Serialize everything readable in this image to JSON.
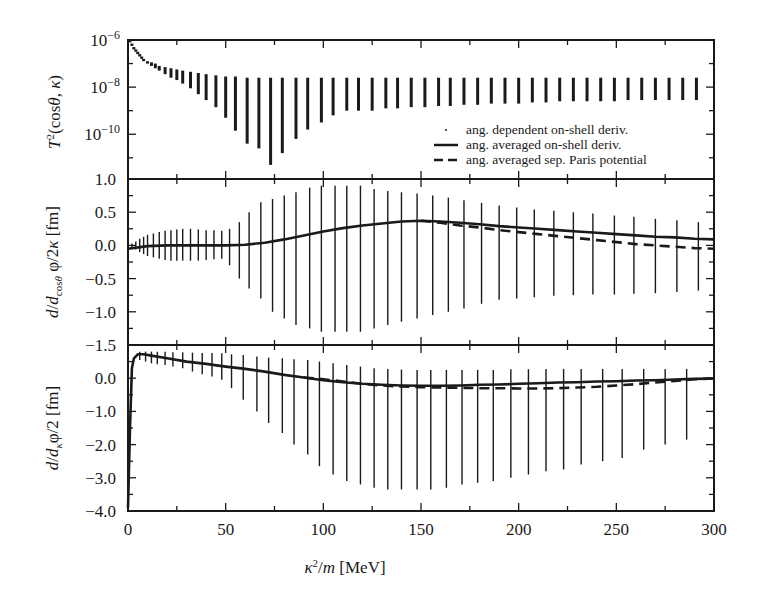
{
  "chart_data": [
    {
      "panel": "top",
      "type": "scatter",
      "ylabel": "T^2(cosθ, κ)",
      "yscale": "log",
      "ylim_exp": [
        -11.9,
        -6
      ],
      "yticks": [
        {
          "exp": -6,
          "label_base": "10",
          "label_exp": "−6"
        },
        {
          "exp": -8,
          "label_base": "10",
          "label_exp": "−8"
        },
        {
          "exp": -10,
          "label_base": "10",
          "label_exp": "−10"
        }
      ],
      "description": "Angle-dependent squared T-matrix: vertical bands of values per energy, log scale",
      "bands": [
        {
          "x": 1,
          "lo": -6.1,
          "hi": -6.0
        },
        {
          "x": 2,
          "lo": -6.25,
          "hi": -6.15
        },
        {
          "x": 3,
          "lo": -6.4,
          "hi": -6.3
        },
        {
          "x": 4,
          "lo": -6.5,
          "hi": -6.4
        },
        {
          "x": 5,
          "lo": -6.6,
          "hi": -6.5
        },
        {
          "x": 6,
          "lo": -6.7,
          "hi": -6.6
        },
        {
          "x": 7,
          "lo": -6.8,
          "hi": -6.7
        },
        {
          "x": 8,
          "lo": -6.9,
          "hi": -6.8
        },
        {
          "x": 10,
          "lo": -7.0,
          "hi": -6.9
        },
        {
          "x": 12,
          "lo": -7.1,
          "hi": -6.95
        },
        {
          "x": 14,
          "lo": -7.2,
          "hi": -7.0
        },
        {
          "x": 16,
          "lo": -7.3,
          "hi": -7.1
        },
        {
          "x": 19,
          "lo": -7.45,
          "hi": -7.15
        },
        {
          "x": 22,
          "lo": -7.6,
          "hi": -7.2
        },
        {
          "x": 25,
          "lo": -7.7,
          "hi": -7.25
        },
        {
          "x": 28,
          "lo": -7.85,
          "hi": -7.3
        },
        {
          "x": 32,
          "lo": -8.05,
          "hi": -7.35
        },
        {
          "x": 36,
          "lo": -8.3,
          "hi": -7.4
        },
        {
          "x": 40,
          "lo": -8.55,
          "hi": -7.45
        },
        {
          "x": 45,
          "lo": -8.85,
          "hi": -7.5
        },
        {
          "x": 50,
          "lo": -9.3,
          "hi": -7.55
        },
        {
          "x": 55,
          "lo": -9.85,
          "hi": -7.55
        },
        {
          "x": 61,
          "lo": -10.4,
          "hi": -7.6
        },
        {
          "x": 67,
          "lo": -10.6,
          "hi": -7.6
        },
        {
          "x": 73,
          "lo": -11.3,
          "hi": -7.6
        },
        {
          "x": 79,
          "lo": -10.8,
          "hi": -7.6
        },
        {
          "x": 86,
          "lo": -10.2,
          "hi": -7.6
        },
        {
          "x": 92,
          "lo": -9.8,
          "hi": -7.6
        },
        {
          "x": 99,
          "lo": -9.5,
          "hi": -7.6
        },
        {
          "x": 105,
          "lo": -9.2,
          "hi": -7.6
        },
        {
          "x": 112,
          "lo": -9.0,
          "hi": -7.6
        },
        {
          "x": 118,
          "lo": -9.0,
          "hi": -7.6
        },
        {
          "x": 125,
          "lo": -9.0,
          "hi": -7.6
        },
        {
          "x": 132,
          "lo": -8.9,
          "hi": -7.6
        },
        {
          "x": 138,
          "lo": -8.9,
          "hi": -7.6
        },
        {
          "x": 145,
          "lo": -8.85,
          "hi": -7.6
        },
        {
          "x": 152,
          "lo": -8.85,
          "hi": -7.6
        },
        {
          "x": 159,
          "lo": -8.8,
          "hi": -7.6
        },
        {
          "x": 165,
          "lo": -8.8,
          "hi": -7.6
        },
        {
          "x": 172,
          "lo": -8.75,
          "hi": -7.6
        },
        {
          "x": 179,
          "lo": -8.75,
          "hi": -7.6
        },
        {
          "x": 186,
          "lo": -8.7,
          "hi": -7.6
        },
        {
          "x": 193,
          "lo": -8.7,
          "hi": -7.6
        },
        {
          "x": 200,
          "lo": -8.7,
          "hi": -7.6
        },
        {
          "x": 207,
          "lo": -8.65,
          "hi": -7.6
        },
        {
          "x": 214,
          "lo": -8.65,
          "hi": -7.6
        },
        {
          "x": 221,
          "lo": -8.6,
          "hi": -7.6
        },
        {
          "x": 228,
          "lo": -8.6,
          "hi": -7.6
        },
        {
          "x": 235,
          "lo": -8.6,
          "hi": -7.6
        },
        {
          "x": 242,
          "lo": -8.6,
          "hi": -7.6
        },
        {
          "x": 249,
          "lo": -8.6,
          "hi": -7.6
        },
        {
          "x": 256,
          "lo": -8.55,
          "hi": -7.6
        },
        {
          "x": 263,
          "lo": -8.55,
          "hi": -7.6
        },
        {
          "x": 270,
          "lo": -8.55,
          "hi": -7.6
        },
        {
          "x": 277,
          "lo": -8.55,
          "hi": -7.6
        },
        {
          "x": 284,
          "lo": -8.55,
          "hi": -7.6
        },
        {
          "x": 291,
          "lo": -8.55,
          "hi": -7.6
        }
      ]
    },
    {
      "panel": "middle",
      "type": "line",
      "ylabel": "d/d_cosθ φ/2κ [fm]",
      "ylim": [
        -1.5,
        1.0
      ],
      "yticks": [
        "1.0",
        "0.5",
        "0.0",
        "−0.5",
        "−1.0",
        "−1.5"
      ],
      "ytick_values": [
        1.0,
        0.5,
        0.0,
        -0.5,
        -1.0,
        -1.5
      ],
      "bands": [
        {
          "x": 2,
          "lo": -0.03,
          "hi": 0.03
        },
        {
          "x": 4,
          "lo": -0.06,
          "hi": 0.06
        },
        {
          "x": 6,
          "lo": -0.1,
          "hi": 0.1
        },
        {
          "x": 8,
          "lo": -0.13,
          "hi": 0.13
        },
        {
          "x": 10,
          "lo": -0.16,
          "hi": 0.16
        },
        {
          "x": 13,
          "lo": -0.18,
          "hi": 0.18
        },
        {
          "x": 16,
          "lo": -0.2,
          "hi": 0.2
        },
        {
          "x": 19,
          "lo": -0.22,
          "hi": 0.22
        },
        {
          "x": 22,
          "lo": -0.23,
          "hi": 0.23
        },
        {
          "x": 25,
          "lo": -0.23,
          "hi": 0.24
        },
        {
          "x": 28,
          "lo": -0.23,
          "hi": 0.25
        },
        {
          "x": 32,
          "lo": -0.23,
          "hi": 0.25
        },
        {
          "x": 36,
          "lo": -0.23,
          "hi": 0.24
        },
        {
          "x": 40,
          "lo": -0.22,
          "hi": 0.23
        },
        {
          "x": 44,
          "lo": -0.21,
          "hi": 0.23
        },
        {
          "x": 48,
          "lo": -0.2,
          "hi": 0.22
        },
        {
          "x": 52,
          "lo": -0.3,
          "hi": 0.25
        },
        {
          "x": 57,
          "lo": -0.5,
          "hi": 0.35
        },
        {
          "x": 62,
          "lo": -0.65,
          "hi": 0.5
        },
        {
          "x": 68,
          "lo": -0.8,
          "hi": 0.65
        },
        {
          "x": 74,
          "lo": -1.0,
          "hi": 0.7
        },
        {
          "x": 80,
          "lo": -1.1,
          "hi": 0.75
        },
        {
          "x": 86,
          "lo": -1.2,
          "hi": 0.8
        },
        {
          "x": 93,
          "lo": -1.25,
          "hi": 0.87
        },
        {
          "x": 99,
          "lo": -1.3,
          "hi": 0.9
        },
        {
          "x": 106,
          "lo": -1.3,
          "hi": 0.9
        },
        {
          "x": 112,
          "lo": -1.3,
          "hi": 0.9
        },
        {
          "x": 119,
          "lo": -1.3,
          "hi": 0.9
        },
        {
          "x": 126,
          "lo": -1.25,
          "hi": 0.85
        },
        {
          "x": 133,
          "lo": -1.2,
          "hi": 0.82
        },
        {
          "x": 140,
          "lo": -1.15,
          "hi": 0.8
        },
        {
          "x": 148,
          "lo": -1.1,
          "hi": 0.78
        },
        {
          "x": 156,
          "lo": -1.05,
          "hi": 0.75
        },
        {
          "x": 164,
          "lo": -1.0,
          "hi": 0.72
        },
        {
          "x": 172,
          "lo": -0.95,
          "hi": 0.68
        },
        {
          "x": 181,
          "lo": -0.88,
          "hi": 0.64
        },
        {
          "x": 190,
          "lo": -0.82,
          "hi": 0.6
        },
        {
          "x": 199,
          "lo": -0.8,
          "hi": 0.57
        },
        {
          "x": 208,
          "lo": -0.78,
          "hi": 0.54
        },
        {
          "x": 218,
          "lo": -0.76,
          "hi": 0.52
        },
        {
          "x": 228,
          "lo": -0.75,
          "hi": 0.5
        },
        {
          "x": 238,
          "lo": -0.74,
          "hi": 0.48
        },
        {
          "x": 249,
          "lo": -0.74,
          "hi": 0.45
        },
        {
          "x": 259,
          "lo": -0.73,
          "hi": 0.43
        },
        {
          "x": 270,
          "lo": -0.72,
          "hi": 0.4
        },
        {
          "x": 281,
          "lo": -0.7,
          "hi": 0.38
        },
        {
          "x": 292,
          "lo": -0.68,
          "hi": 0.35
        }
      ],
      "series": [
        {
          "name": "ang. averaged on-shell deriv.",
          "style": "solid",
          "x": [
            0,
            10,
            20,
            30,
            40,
            50,
            60,
            70,
            80,
            90,
            100,
            110,
            120,
            130,
            140,
            150,
            160,
            170,
            180,
            190,
            200,
            210,
            220,
            230,
            240,
            250,
            260,
            270,
            280,
            290,
            300
          ],
          "y": [
            -0.05,
            -0.01,
            0.0,
            0.0,
            0.0,
            0.0,
            0.01,
            0.04,
            0.09,
            0.15,
            0.21,
            0.26,
            0.3,
            0.33,
            0.36,
            0.37,
            0.36,
            0.34,
            0.32,
            0.29,
            0.27,
            0.25,
            0.23,
            0.21,
            0.19,
            0.17,
            0.15,
            0.13,
            0.12,
            0.1,
            0.09
          ]
        },
        {
          "name": "ang. averaged sep. Paris potential",
          "style": "dashed",
          "x": [
            150,
            160,
            170,
            180,
            190,
            200,
            210,
            220,
            230,
            240,
            250,
            260,
            270,
            280,
            290,
            300
          ],
          "y": [
            0.37,
            0.34,
            0.3,
            0.27,
            0.23,
            0.2,
            0.17,
            0.14,
            0.11,
            0.08,
            0.05,
            0.02,
            -0.0,
            -0.02,
            -0.04,
            -0.05
          ]
        }
      ]
    },
    {
      "panel": "bottom",
      "type": "line",
      "ylabel": "d/d_κ φ/2 [fm]",
      "ylim": [
        -4.0,
        1.0
      ],
      "yticks": [
        "0.0",
        "−1.0",
        "−2.0",
        "−3.0",
        "−4.0"
      ],
      "ytick_values": [
        0.0,
        -1.0,
        -2.0,
        -3.0,
        -4.0
      ],
      "bands": [
        {
          "x": 6,
          "lo": 0.55,
          "hi": 0.8
        },
        {
          "x": 9,
          "lo": 0.5,
          "hi": 0.8
        },
        {
          "x": 12,
          "lo": 0.45,
          "hi": 0.8
        },
        {
          "x": 15,
          "lo": 0.42,
          "hi": 0.8
        },
        {
          "x": 19,
          "lo": 0.4,
          "hi": 0.8
        },
        {
          "x": 23,
          "lo": 0.35,
          "hi": 0.78
        },
        {
          "x": 28,
          "lo": 0.3,
          "hi": 0.78
        },
        {
          "x": 33,
          "lo": 0.2,
          "hi": 0.77
        },
        {
          "x": 38,
          "lo": 0.12,
          "hi": 0.76
        },
        {
          "x": 43,
          "lo": 0.05,
          "hi": 0.76
        },
        {
          "x": 48,
          "lo": -0.05,
          "hi": 0.75
        },
        {
          "x": 53,
          "lo": -0.3,
          "hi": 0.72
        },
        {
          "x": 59,
          "lo": -0.65,
          "hi": 0.7
        },
        {
          "x": 66,
          "lo": -1.0,
          "hi": 0.65
        },
        {
          "x": 72,
          "lo": -1.35,
          "hi": 0.62
        },
        {
          "x": 79,
          "lo": -1.65,
          "hi": 0.6
        },
        {
          "x": 85,
          "lo": -2.0,
          "hi": 0.57
        },
        {
          "x": 92,
          "lo": -2.3,
          "hi": 0.55
        },
        {
          "x": 98,
          "lo": -2.65,
          "hi": 0.5
        },
        {
          "x": 105,
          "lo": -2.9,
          "hi": 0.45
        },
        {
          "x": 112,
          "lo": -3.1,
          "hi": 0.4
        },
        {
          "x": 119,
          "lo": -3.2,
          "hi": 0.35
        },
        {
          "x": 126,
          "lo": -3.3,
          "hi": 0.3
        },
        {
          "x": 133,
          "lo": -3.35,
          "hi": 0.28
        },
        {
          "x": 140,
          "lo": -3.35,
          "hi": 0.26
        },
        {
          "x": 148,
          "lo": -3.35,
          "hi": 0.25
        },
        {
          "x": 155,
          "lo": -3.35,
          "hi": 0.25
        },
        {
          "x": 163,
          "lo": -3.3,
          "hi": 0.25
        },
        {
          "x": 171,
          "lo": -3.2,
          "hi": 0.25
        },
        {
          "x": 179,
          "lo": -3.15,
          "hi": 0.25
        },
        {
          "x": 187,
          "lo": -3.1,
          "hi": 0.25
        },
        {
          "x": 196,
          "lo": -3.0,
          "hi": 0.27
        },
        {
          "x": 205,
          "lo": -2.9,
          "hi": 0.27
        },
        {
          "x": 214,
          "lo": -2.8,
          "hi": 0.28
        },
        {
          "x": 223,
          "lo": -2.75,
          "hi": 0.28
        },
        {
          "x": 232,
          "lo": -2.6,
          "hi": 0.28
        },
        {
          "x": 243,
          "lo": -2.5,
          "hi": 0.28
        },
        {
          "x": 253,
          "lo": -2.4,
          "hi": 0.28
        },
        {
          "x": 264,
          "lo": -2.15,
          "hi": 0.28
        },
        {
          "x": 275,
          "lo": -2.0,
          "hi": 0.28
        },
        {
          "x": 286,
          "lo": -1.85,
          "hi": 0.28
        }
      ],
      "series": [
        {
          "name": "ang. averaged on-shell deriv.",
          "style": "solid",
          "x": [
            0,
            1,
            2,
            3,
            5,
            8,
            12,
            20,
            30,
            40,
            50,
            60,
            70,
            80,
            90,
            100,
            110,
            120,
            130,
            140,
            150,
            160,
            170,
            180,
            190,
            200,
            210,
            220,
            230,
            240,
            250,
            260,
            270,
            280,
            290,
            300
          ],
          "y": [
            -3.9,
            -1.5,
            0.3,
            0.6,
            0.72,
            0.72,
            0.68,
            0.6,
            0.5,
            0.43,
            0.35,
            0.28,
            0.2,
            0.1,
            0.02,
            -0.06,
            -0.12,
            -0.17,
            -0.2,
            -0.22,
            -0.23,
            -0.23,
            -0.22,
            -0.2,
            -0.19,
            -0.17,
            -0.15,
            -0.13,
            -0.12,
            -0.1,
            -0.09,
            -0.07,
            -0.06,
            -0.04,
            -0.02,
            -0.01
          ]
        },
        {
          "name": "ang. averaged sep. Paris potential",
          "style": "dashed",
          "x": [
            90,
            100,
            110,
            120,
            130,
            140,
            150,
            160,
            170,
            180,
            190,
            200,
            210,
            220,
            230,
            240,
            250,
            260,
            270,
            280,
            290,
            300
          ],
          "y": [
            0.02,
            -0.03,
            -0.1,
            -0.17,
            -0.22,
            -0.25,
            -0.27,
            -0.28,
            -0.29,
            -0.3,
            -0.3,
            -0.31,
            -0.31,
            -0.3,
            -0.28,
            -0.26,
            -0.22,
            -0.18,
            -0.13,
            -0.08,
            -0.03,
            -0.01
          ]
        }
      ]
    }
  ],
  "x_axis": {
    "label": "κ²/m [MeV]",
    "xlim": [
      0,
      300
    ],
    "ticks": [
      "0",
      "50",
      "100",
      "150",
      "200",
      "250",
      "300"
    ],
    "tick_values": [
      0,
      50,
      100,
      150,
      200,
      250,
      300
    ]
  },
  "legend": {
    "position": "top-panel lower right",
    "entries": [
      {
        "marker": "dot",
        "label": "ang. dependent on-shell deriv."
      },
      {
        "marker": "solid",
        "label": "ang. averaged on-shell deriv."
      },
      {
        "marker": "dashed",
        "label": "ang. averaged sep. Paris potential"
      }
    ]
  },
  "colors": {
    "ink": "#1a1a1a",
    "background": "#ffffff"
  }
}
